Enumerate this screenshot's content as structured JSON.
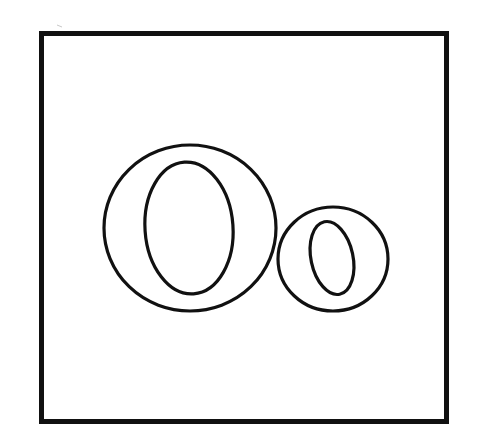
{
  "card": {
    "letters": "Oo",
    "uppercase": "O",
    "lowercase": "o",
    "stroke_color": "#111111",
    "background_color": "#ffffff"
  }
}
